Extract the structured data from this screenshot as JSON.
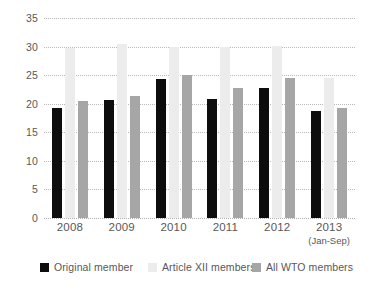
{
  "chart_data": {
    "type": "bar",
    "title": "",
    "subtitle": "",
    "xlabel": "",
    "ylabel": "",
    "ylim": [
      0,
      35
    ],
    "ytick_step": 5,
    "ytick_labels": [
      "0",
      "5",
      "10",
      "15",
      "20",
      "25",
      "30",
      "35"
    ],
    "grid": true,
    "grid_style": "dotted-horizontal",
    "legend_position": "bottom",
    "categories": [
      "2008",
      "2009",
      "2010",
      "2011",
      "2012",
      "2013"
    ],
    "category_sublabels": [
      "",
      "",
      "",
      "",
      "",
      "(Jan-Sep)"
    ],
    "series": [
      {
        "name": "Original member",
        "color": "#0d0d0d",
        "values": [
          19.3,
          20.6,
          24.4,
          20.8,
          22.8,
          18.7
        ]
      },
      {
        "name": "Article XII members",
        "color": "#ececec",
        "values": [
          29.8,
          30.4,
          29.9,
          29.9,
          30.1,
          24.5
        ]
      },
      {
        "name": "All WTO members",
        "color": "#a6a6a6",
        "values": [
          20.5,
          21.3,
          25.1,
          22.7,
          24.5,
          19.3
        ]
      }
    ]
  },
  "legend": {
    "items": [
      {
        "label": "Original member"
      },
      {
        "label": "Article XII members"
      },
      {
        "label": "All WTO members"
      }
    ]
  }
}
